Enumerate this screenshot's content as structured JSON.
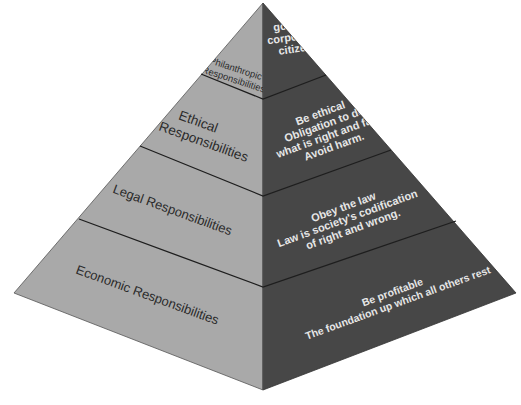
{
  "diagram": {
    "type": "pyramid",
    "title": "",
    "colors": {
      "left_face": "#a9a9a9",
      "right_face": "#474747",
      "divider": "#1e1e1e",
      "left_text": "#2b2b2b",
      "right_text": "#e6e6e6",
      "background": "#ffffff"
    },
    "levels": [
      {
        "id": "philanthropic",
        "left_label_lines": [
          "Philanthropic",
          "Responsibilities"
        ],
        "right_lines": [
          "Be",
          "good",
          "corporate",
          "citizen"
        ]
      },
      {
        "id": "ethical",
        "left_label_lines": [
          "Ethical",
          "Responsibilities"
        ],
        "right_lines": [
          "Be ethical",
          "Obligation to do",
          "what is right and fair.",
          "Avoid harm."
        ]
      },
      {
        "id": "legal",
        "left_label_lines": [
          "Legal Responsibilities"
        ],
        "right_lines": [
          "Obey the law",
          "Law is society's codification",
          "of right and wrong."
        ]
      },
      {
        "id": "economic",
        "left_label_lines": [
          "Economic Responsibilities"
        ],
        "right_lines": [
          "Be profitable",
          "The foundation up which all others rest"
        ]
      }
    ]
  }
}
